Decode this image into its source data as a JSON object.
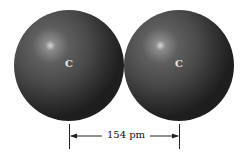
{
  "atoms": [
    {
      "symbol": "C",
      "color": "#3a3a3a"
    },
    {
      "symbol": "C",
      "color": "#3a3a3a"
    }
  ],
  "bond_length": {
    "label": "154 pm",
    "value": 154,
    "unit": "pm"
  }
}
